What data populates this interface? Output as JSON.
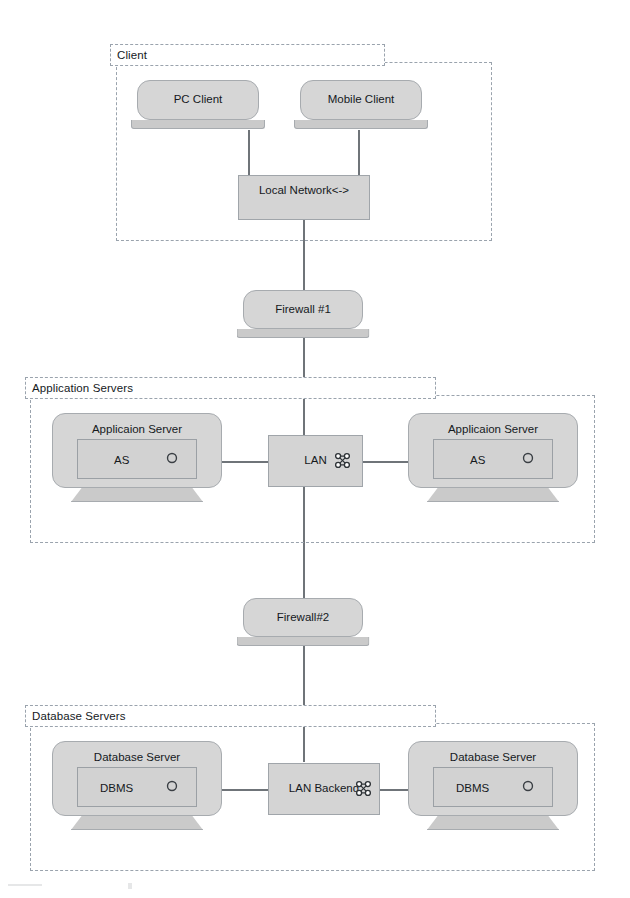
{
  "diagram": {
    "colors": {
      "shape_fill": "#d6d6d6",
      "panel_fill": "#d2d2d2",
      "stand_fill": "#cacaca",
      "stroke": "#a7abaf",
      "zone_border": "#9aa3ad",
      "connector": "#6f7479",
      "text": "#15191d"
    }
  },
  "zones": [
    {
      "id": "client",
      "label": "Client"
    },
    {
      "id": "app",
      "label": "Application Servers"
    },
    {
      "id": "database",
      "label": "Database Servers"
    }
  ],
  "nodes": {
    "pc_client": {
      "label": "PC Client"
    },
    "mobile_client": {
      "label": "Mobile Client"
    },
    "local_network": {
      "label": "Local Network<->"
    },
    "firewall_1": {
      "label": "Firewall #1"
    },
    "app_server_left": {
      "label": "Applicaion Server",
      "panel": "AS"
    },
    "app_server_right": {
      "label": "Applicaion Server",
      "panel": "AS"
    },
    "lan": {
      "label": "LAN",
      "icon": "network-cluster-icon"
    },
    "firewall_2": {
      "label": "Firewall#2"
    },
    "db_server_left": {
      "label": "Database Server",
      "panel": "DBMS"
    },
    "db_server_right": {
      "label": "Database Server",
      "panel": "DBMS"
    },
    "lan_backend": {
      "label": "LAN Backend",
      "icon": "network-cluster-icon"
    }
  },
  "connections": [
    {
      "from": "pc_client",
      "to": "local_network"
    },
    {
      "from": "mobile_client",
      "to": "local_network"
    },
    {
      "from": "local_network",
      "to": "firewall_1"
    },
    {
      "from": "firewall_1",
      "to": "lan"
    },
    {
      "from": "app_server_left",
      "to": "lan"
    },
    {
      "from": "app_server_right",
      "to": "lan"
    },
    {
      "from": "lan",
      "to": "firewall_2"
    },
    {
      "from": "firewall_2",
      "to": "lan_backend"
    },
    {
      "from": "db_server_left",
      "to": "lan_backend"
    },
    {
      "from": "db_server_right",
      "to": "lan_backend"
    }
  ]
}
